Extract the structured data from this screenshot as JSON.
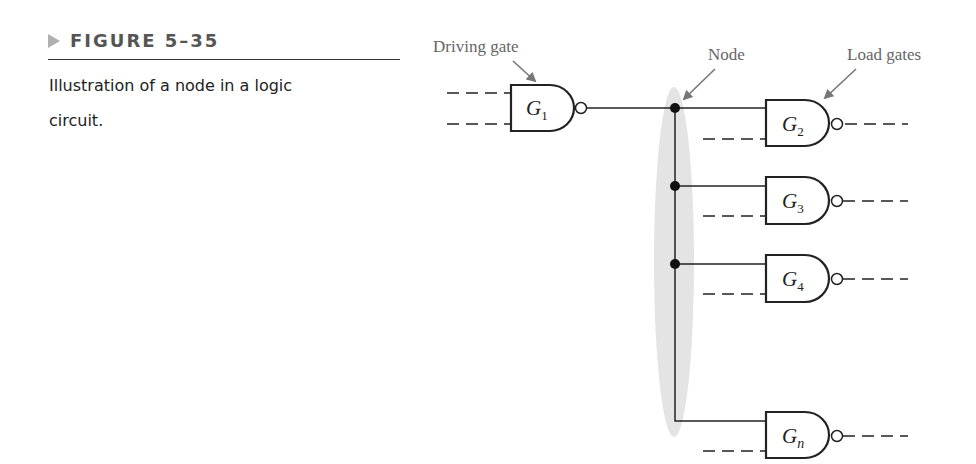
{
  "caption": {
    "figure_label": "FIGURE 5–35",
    "description": "Illustration of a node in a logic circuit."
  },
  "diagram": {
    "labels": {
      "driving_gate": "Driving gate",
      "node": "Node",
      "load_gates": "Load gates"
    },
    "driving_gate": {
      "name": "G",
      "subscript": "1",
      "type": "NAND"
    },
    "load_gates": [
      {
        "name": "G",
        "subscript": "2",
        "type": "NAND"
      },
      {
        "name": "G",
        "subscript": "3",
        "type": "NAND"
      },
      {
        "name": "G",
        "subscript": "4",
        "type": "NAND"
      },
      {
        "name": "G",
        "subscript": "n",
        "type": "NAND"
      }
    ],
    "colors": {
      "wire": "#222222",
      "label": "#666666",
      "node_highlight": "#e4e4e4",
      "arrow": "#777777"
    }
  }
}
